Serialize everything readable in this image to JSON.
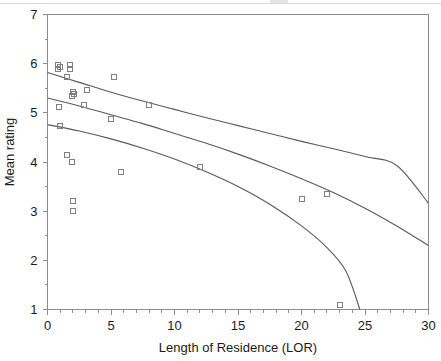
{
  "chart_data": {
    "type": "scatter",
    "title": "",
    "xlabel": "Length of Residence (LOR)",
    "ylabel": "Mean rating",
    "xlim": [
      0,
      30
    ],
    "ylim": [
      1,
      7
    ],
    "xticks": [
      0,
      5,
      10,
      15,
      20,
      25,
      30
    ],
    "yticks": [
      1,
      2,
      3,
      4,
      5,
      6,
      7
    ],
    "xtick_labels": [
      "0",
      "5",
      "10",
      "15",
      "20",
      "25",
      "30"
    ],
    "ytick_labels": [
      "1",
      "2",
      "3",
      "4",
      "5",
      "6",
      "7"
    ],
    "minor_ticks_x": true,
    "minor_ticks_y": true,
    "grid": false,
    "legend": null,
    "marker": "open-square",
    "marker_color": "#808080",
    "line_color": "#595959",
    "points": [
      {
        "x": 0.8,
        "y": 5.98
      },
      {
        "x": 0.8,
        "y": 5.9
      },
      {
        "x": 1.0,
        "y": 5.93
      },
      {
        "x": 1.8,
        "y": 5.98
      },
      {
        "x": 1.8,
        "y": 5.9
      },
      {
        "x": 1.5,
        "y": 5.73
      },
      {
        "x": 2.0,
        "y": 5.43
      },
      {
        "x": 2.1,
        "y": 5.38
      },
      {
        "x": 1.9,
        "y": 5.35
      },
      {
        "x": 3.1,
        "y": 5.46
      },
      {
        "x": 0.9,
        "y": 5.12
      },
      {
        "x": 2.9,
        "y": 5.17
      },
      {
        "x": 1.0,
        "y": 4.73
      },
      {
        "x": 1.5,
        "y": 4.15
      },
      {
        "x": 1.9,
        "y": 4.0
      },
      {
        "x": 2.0,
        "y": 3.2
      },
      {
        "x": 2.0,
        "y": 3.0
      },
      {
        "x": 5.2,
        "y": 5.73
      },
      {
        "x": 5.0,
        "y": 4.88
      },
      {
        "x": 8.0,
        "y": 5.17
      },
      {
        "x": 5.8,
        "y": 3.8
      },
      {
        "x": 12.0,
        "y": 3.9
      },
      {
        "x": 20.0,
        "y": 3.25
      },
      {
        "x": 22.0,
        "y": 3.35
      },
      {
        "x": 23.0,
        "y": 1.1
      }
    ],
    "series": [
      {
        "name": "upper-confidence-curve",
        "type": "curve",
        "points": [
          {
            "x": 0.0,
            "y": 5.82
          },
          {
            "x": 2.5,
            "y": 5.62
          },
          {
            "x": 5.0,
            "y": 5.42
          },
          {
            "x": 7.5,
            "y": 5.24
          },
          {
            "x": 10.0,
            "y": 5.07
          },
          {
            "x": 12.5,
            "y": 4.9
          },
          {
            "x": 15.0,
            "y": 4.74
          },
          {
            "x": 17.5,
            "y": 4.58
          },
          {
            "x": 20.0,
            "y": 4.42
          },
          {
            "x": 22.5,
            "y": 4.27
          },
          {
            "x": 25.0,
            "y": 4.11
          },
          {
            "x": 27.5,
            "y": 3.93
          },
          {
            "x": 30.0,
            "y": 3.16
          }
        ]
      },
      {
        "name": "regression-line",
        "type": "curve",
        "points": [
          {
            "x": 0.0,
            "y": 5.3
          },
          {
            "x": 2.5,
            "y": 5.14
          },
          {
            "x": 5.0,
            "y": 4.96
          },
          {
            "x": 7.5,
            "y": 4.78
          },
          {
            "x": 10.0,
            "y": 4.58
          },
          {
            "x": 12.5,
            "y": 4.38
          },
          {
            "x": 15.0,
            "y": 4.16
          },
          {
            "x": 17.5,
            "y": 3.92
          },
          {
            "x": 20.0,
            "y": 3.66
          },
          {
            "x": 22.5,
            "y": 3.38
          },
          {
            "x": 25.0,
            "y": 3.06
          },
          {
            "x": 27.5,
            "y": 2.7
          },
          {
            "x": 30.0,
            "y": 2.3
          }
        ]
      },
      {
        "name": "lower-confidence-curve",
        "type": "curve",
        "points": [
          {
            "x": 0.0,
            "y": 4.76
          },
          {
            "x": 2.5,
            "y": 4.63
          },
          {
            "x": 5.0,
            "y": 4.47
          },
          {
            "x": 7.5,
            "y": 4.28
          },
          {
            "x": 10.0,
            "y": 4.06
          },
          {
            "x": 12.5,
            "y": 3.8
          },
          {
            "x": 15.0,
            "y": 3.5
          },
          {
            "x": 17.5,
            "y": 3.14
          },
          {
            "x": 20.0,
            "y": 2.7
          },
          {
            "x": 22.0,
            "y": 2.26
          },
          {
            "x": 23.5,
            "y": 1.78
          },
          {
            "x": 24.6,
            "y": 1.0
          }
        ]
      }
    ]
  }
}
